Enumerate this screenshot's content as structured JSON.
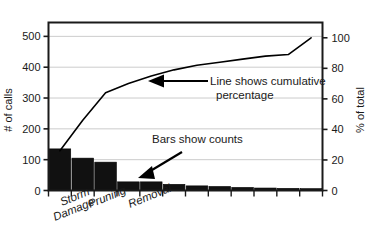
{
  "chart_data": {
    "type": "bar",
    "title": "",
    "subtitle": "",
    "xlabel": "",
    "ylabel": "# of calls",
    "y2label": "% of total",
    "grid": true,
    "legend_position": "none",
    "ylim": [
      0,
      545
    ],
    "y2lim": [
      0,
      110
    ],
    "y_ticks": [
      0,
      100,
      200,
      300,
      400,
      500
    ],
    "y2_ticks": [
      0,
      20,
      40,
      60,
      80,
      100
    ],
    "categories": [
      "Storm Damage",
      "Pruning",
      "Removal",
      "",
      "",
      "",
      "",
      "",
      "",
      "",
      "",
      ""
    ],
    "visible_category_labels": [
      "Storm Damage",
      "Pruning",
      "Removal"
    ],
    "values": [
      135,
      105,
      92,
      28,
      28,
      20,
      15,
      13,
      10,
      8,
      7,
      6
    ],
    "series": [
      {
        "name": "Bars show counts",
        "type": "bar",
        "values": [
          135,
          105,
          92,
          28,
          28,
          20,
          15,
          13,
          10,
          8,
          7,
          6
        ]
      },
      {
        "name": "Line shows cumulative percentage",
        "type": "line",
        "axis": "right",
        "values": [
          26,
          46,
          64,
          70,
          75,
          79,
          82,
          84,
          86,
          88,
          89,
          100
        ]
      }
    ],
    "annotations": [
      {
        "name": "cumulative-line-annotation",
        "text_line1": "Line shows cumulative",
        "text_line2": "percentage",
        "arrow": "left"
      },
      {
        "name": "bars-annotation",
        "text_line1": "Bars show counts",
        "text_line2": "",
        "arrow": "down-left"
      }
    ],
    "colors": {
      "bar": "#111111",
      "line": "#000000",
      "axis": "#1a1a1a",
      "grid": "#cccccc",
      "background": "#ffffff"
    }
  },
  "axes": {
    "left": {
      "title": "# of calls",
      "ticks": [
        "0",
        "100",
        "200",
        "300",
        "400",
        "500"
      ]
    },
    "right": {
      "title": "% of total",
      "ticks": [
        "0",
        "20",
        "40",
        "60",
        "80",
        "100"
      ]
    },
    "bottom": {
      "labels": [
        "Storm Damage",
        "Pruning",
        "Removal"
      ],
      "label_storm_line1": "Storm",
      "label_storm_line2": "Damage",
      "label_pruning": "Pruning",
      "label_removal": "Removal"
    }
  },
  "annotations": {
    "line_note_l1": "Line shows cumulative",
    "line_note_l2": "percentage",
    "bars_note": "Bars show counts"
  }
}
